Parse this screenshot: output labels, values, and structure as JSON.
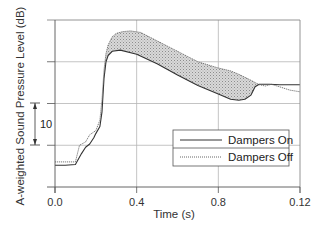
{
  "chart_data": {
    "type": "line",
    "title": "",
    "xlabel": "Time (s)",
    "ylabel": "A-weighted Sound Pressure Level (dB)",
    "x_tick_values": [
      0.0,
      0.4,
      0.8,
      1.2
    ],
    "x_tick_labels": [
      "0.0",
      "0.4",
      "0.8",
      "0.12"
    ],
    "xlim": [
      0.0,
      1.2
    ],
    "ylim": [
      0,
      40
    ],
    "y_gridlines": [
      10,
      20,
      30
    ],
    "y_tick_labels_shown": false,
    "grid": true,
    "legend_position": "bottom-right",
    "shaded_region": {
      "between": [
        "Dampers On",
        "Dampers Off"
      ],
      "color": "#c8c8c8",
      "pattern": "stipple"
    },
    "scale_annotation": {
      "label": "10",
      "from": 10,
      "to": 20,
      "units": "dB"
    },
    "series": [
      {
        "name": "Dampers On",
        "style": "solid",
        "color": "#333333",
        "x": [
          0.0,
          0.05,
          0.1,
          0.13,
          0.15,
          0.17,
          0.19,
          0.2,
          0.22,
          0.23,
          0.24,
          0.25,
          0.26,
          0.28,
          0.32,
          0.4,
          0.5,
          0.6,
          0.7,
          0.8,
          0.86,
          0.9,
          0.93,
          0.96,
          0.98,
          1.0,
          1.05,
          1.1,
          1.15,
          1.2
        ],
        "y": [
          5.2,
          5.2,
          5.4,
          8.0,
          9.5,
          10.3,
          11.8,
          12.8,
          14.5,
          18.0,
          26.0,
          30.0,
          31.5,
          32.5,
          32.8,
          31.8,
          29.5,
          26.8,
          24.3,
          22.3,
          21.0,
          20.8,
          21.0,
          22.0,
          24.0,
          24.6,
          24.6,
          24.5,
          24.5,
          24.5
        ]
      },
      {
        "name": "Dampers Off",
        "style": "dotted",
        "color": "#666666",
        "x": [
          0.0,
          0.05,
          0.1,
          0.12,
          0.15,
          0.17,
          0.2,
          0.22,
          0.23,
          0.24,
          0.25,
          0.26,
          0.28,
          0.3,
          0.33,
          0.37,
          0.42,
          0.5,
          0.6,
          0.7,
          0.8,
          0.86,
          0.9,
          0.95,
          1.0,
          1.03,
          1.06,
          1.1,
          1.15,
          1.2
        ],
        "y": [
          6.0,
          6.0,
          6.0,
          10.0,
          10.8,
          12.5,
          13.5,
          16.0,
          21.0,
          28.0,
          32.0,
          34.0,
          36.0,
          36.8,
          37.2,
          37.4,
          37.0,
          35.0,
          32.5,
          30.0,
          28.5,
          27.8,
          27.0,
          25.8,
          24.5,
          24.2,
          24.6,
          24.0,
          23.2,
          22.8
        ]
      }
    ]
  },
  "legend": {
    "items": [
      {
        "label": "Dampers On",
        "style": "solid"
      },
      {
        "label": "Dampers Off",
        "style": "dotted"
      }
    ]
  }
}
